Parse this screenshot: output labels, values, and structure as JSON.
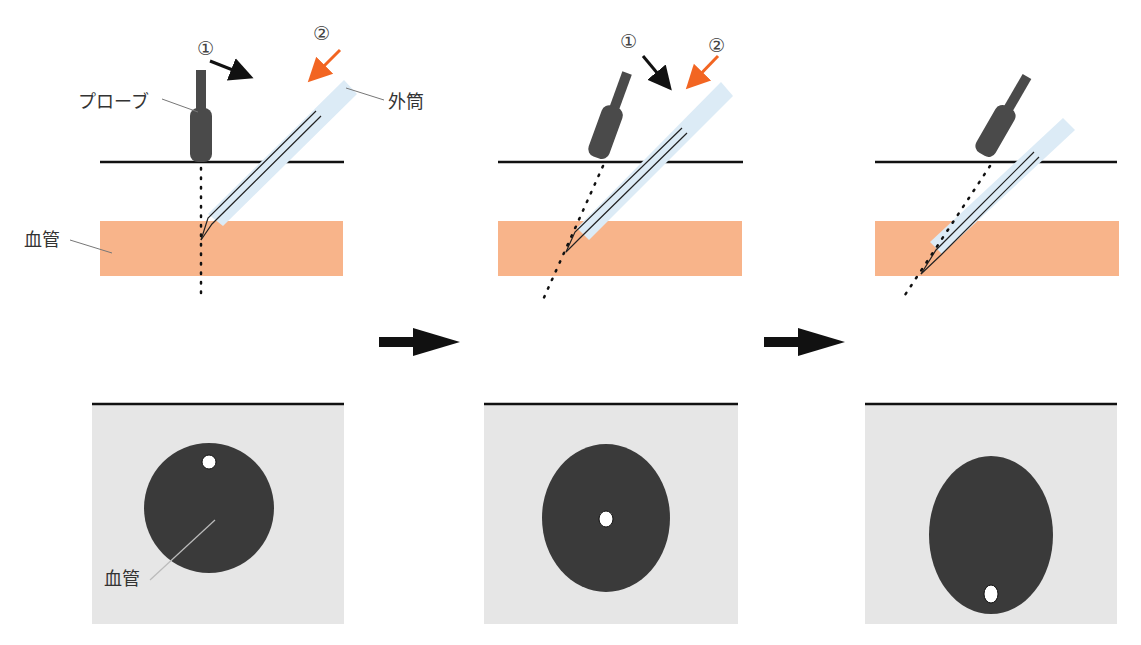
{
  "labels": {
    "probe": "プローブ",
    "outer_sheath": "外筒",
    "vessel_long": "血管",
    "vessel_short": "血管",
    "step1": "①",
    "step2": "②"
  },
  "panels": [
    {
      "id": "step-a",
      "probe_angle": "vertical",
      "needle_tip": "above vessel center (long axis)",
      "short_axis_tip_position": "top of vessel"
    },
    {
      "id": "step-b",
      "probe_angle": "tilted",
      "needle_tip": "inside vessel",
      "short_axis_tip_position": "center of vessel"
    },
    {
      "id": "step-c",
      "probe_angle": "tilted further",
      "needle_tip": "deeper in vessel",
      "short_axis_tip_position": "bottom of vessel"
    }
  ],
  "colors": {
    "vessel_long": "#f8b48a",
    "ultrasound_bg": "#e6e6e6",
    "vessel_short": "#3a3a3a",
    "probe": "#4a4a4a",
    "sheath": "#dcebf6",
    "arrow_step2": "#f26522",
    "arrow_step1": "#111111"
  }
}
